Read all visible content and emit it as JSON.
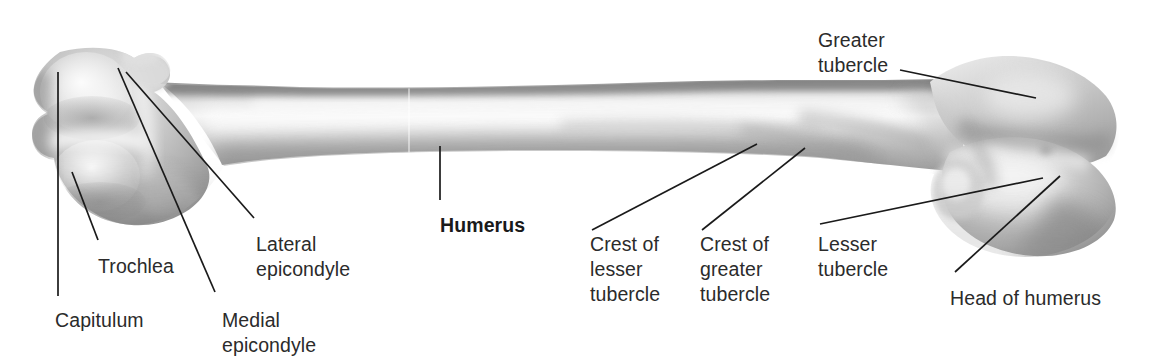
{
  "figure": {
    "subject": "Humerus",
    "view": "anterior view of right humerus",
    "background_color": "#ffffff",
    "text_color": "#2b2b2b",
    "leader_line_color": "#1a1a1a",
    "bone_tones": {
      "light": "#f2f2f2",
      "mid": "#c9c9c9",
      "shadow": "#9a9a9a",
      "dark_edge": "#7d7d7d",
      "highlight": "#fbfbfb"
    }
  },
  "labels": [
    {
      "id": "greater-tubercle",
      "lines": [
        "Greater",
        "tubercle"
      ],
      "x": 818,
      "y": 28,
      "bold": false,
      "align": "left"
    },
    {
      "id": "humerus",
      "lines": [
        "Humerus"
      ],
      "x": 440,
      "y": 213,
      "bold": true,
      "align": "left"
    },
    {
      "id": "lateral-epicondyle",
      "lines": [
        "Lateral",
        "epicondyle"
      ],
      "x": 256,
      "y": 232,
      "bold": false,
      "align": "left"
    },
    {
      "id": "crest-of-lesser-tubercle",
      "lines": [
        "Crest of",
        "lesser",
        "tubercle"
      ],
      "x": 590,
      "y": 232,
      "bold": false,
      "align": "left"
    },
    {
      "id": "crest-of-greater-tubercle",
      "lines": [
        "Crest of",
        "greater",
        "tubercle"
      ],
      "x": 700,
      "y": 232,
      "bold": false,
      "align": "left"
    },
    {
      "id": "lesser-tubercle",
      "lines": [
        "Lesser",
        "tubercle"
      ],
      "x": 818,
      "y": 232,
      "bold": false,
      "align": "left"
    },
    {
      "id": "trochlea",
      "lines": [
        "Trochlea"
      ],
      "x": 98,
      "y": 254,
      "bold": false,
      "align": "left"
    },
    {
      "id": "head-of-humerus",
      "lines": [
        "Head of humerus"
      ],
      "x": 950,
      "y": 286,
      "bold": false,
      "align": "left"
    },
    {
      "id": "capitulum",
      "lines": [
        "Capitulum"
      ],
      "x": 55,
      "y": 308,
      "bold": false,
      "align": "left"
    },
    {
      "id": "medial-epicondyle",
      "lines": [
        "Medial",
        "epicondyle"
      ],
      "x": 222,
      "y": 308,
      "bold": false,
      "align": "left"
    }
  ],
  "leader_lines": [
    {
      "id": "leader-capitulum",
      "x1": 58,
      "y1": 72,
      "x2": 58,
      "y2": 296
    },
    {
      "id": "leader-trochlea",
      "x1": 72,
      "y1": 172,
      "x2": 98,
      "y2": 240
    },
    {
      "id": "leader-medial-epicondyle",
      "x1": 118,
      "y1": 68,
      "x2": 215,
      "y2": 292
    },
    {
      "id": "leader-lateral-epicondyle",
      "x1": 126,
      "y1": 72,
      "x2": 254,
      "y2": 218
    },
    {
      "id": "leader-humerus",
      "x1": 440,
      "y1": 146,
      "x2": 440,
      "y2": 200
    },
    {
      "id": "leader-crest-lesser-tubercle",
      "x1": 757,
      "y1": 144,
      "x2": 592,
      "y2": 230
    },
    {
      "id": "leader-crest-greater-tubercle",
      "x1": 805,
      "y1": 148,
      "x2": 702,
      "y2": 230
    },
    {
      "id": "leader-lesser-tubercle",
      "x1": 1043,
      "y1": 178,
      "x2": 820,
      "y2": 224
    },
    {
      "id": "leader-greater-tubercle",
      "x1": 1036,
      "y1": 98,
      "x2": 900,
      "y2": 70
    },
    {
      "id": "leader-head-of-humerus",
      "x1": 1060,
      "y1": 176,
      "x2": 955,
      "y2": 272
    }
  ],
  "bone": {
    "outline_note": "anterior humerus, distal (condyles) at left, proximal (head) at right",
    "distal_left_x": 20,
    "proximal_right_x": 1120,
    "shaft_top_y": 84,
    "shaft_bottom_y": 152
  }
}
